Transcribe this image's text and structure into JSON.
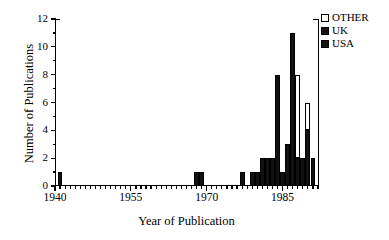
{
  "chart_data": {
    "type": "bar",
    "title": "",
    "xlabel": "Year of Publication",
    "ylabel": "Number of Publications",
    "xlim": [
      1940,
      1992
    ],
    "ylim": [
      0,
      12
    ],
    "yticks": [
      0,
      2,
      4,
      6,
      8,
      10,
      12
    ],
    "xticks": [
      1940,
      1955,
      1970,
      1985
    ],
    "xtick_labels": [
      "1940",
      "1955",
      "1970",
      "1985"
    ],
    "ytick_labels": [
      "0",
      "2",
      "4",
      "6",
      "8",
      "10",
      "12"
    ],
    "minor_tick_interval": 1,
    "grid": false,
    "stacked": true,
    "legend_position": "top-right",
    "legend": [
      {
        "name": "OTHER",
        "color": "#ffffff",
        "edge": "#000000"
      },
      {
        "name": "UK",
        "color": "#141414",
        "edge": "#000000"
      },
      {
        "name": "USA",
        "color": "#141414",
        "edge": "#000000"
      }
    ],
    "categories": [
      1941,
      1968,
      1969,
      1977,
      1979,
      1980,
      1981,
      1982,
      1983,
      1984,
      1985,
      1986,
      1987,
      1988,
      1989,
      1990,
      1991
    ],
    "series": [
      {
        "name": "USA",
        "values": [
          1,
          1,
          1,
          1,
          1,
          1,
          2,
          2,
          2,
          8,
          1,
          3,
          11,
          2,
          2,
          4,
          2
        ]
      },
      {
        "name": "UK",
        "values": [
          0,
          0,
          0,
          0,
          0,
          0,
          0,
          0,
          0,
          0,
          0,
          0,
          0,
          0,
          0,
          0,
          0
        ]
      },
      {
        "name": "OTHER",
        "values": [
          0,
          0,
          0,
          0,
          0,
          0,
          0,
          0,
          0,
          0,
          0,
          0,
          0,
          6,
          0,
          2,
          0
        ]
      }
    ],
    "totals": [
      1,
      1,
      1,
      1,
      1,
      1,
      2,
      2,
      2,
      8,
      1,
      3,
      11,
      8,
      2,
      6,
      2
    ],
    "bar_width_years": 1
  }
}
